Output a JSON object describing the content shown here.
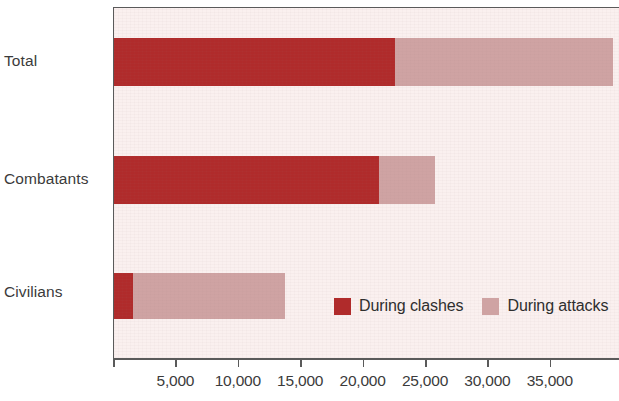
{
  "chart_data": {
    "type": "bar",
    "orientation": "horizontal",
    "stacked": true,
    "title": "",
    "subtitle": "",
    "xlabel": "",
    "ylabel": "",
    "grid": false,
    "legend_position": "inside-bottom-right",
    "categories": [
      "Total",
      "Combatants",
      "Civilians"
    ],
    "series": [
      {
        "name": "During clashes",
        "color": "#b02b2b",
        "values": [
          22500,
          21200,
          1500
        ]
      },
      {
        "name": "During attacks",
        "color": "#cfa3a3",
        "values": [
          17500,
          4500,
          12200
        ]
      }
    ],
    "totals": [
      40000,
      25700,
      13700
    ],
    "xlim": [
      0,
      40600
    ],
    "x_tick_values": [
      5000,
      10000,
      15000,
      20000,
      25000,
      30000,
      35000
    ],
    "x_tick_labels": [
      "5,000",
      "10,000",
      "15,000",
      "20,000",
      "25,000",
      "30,000",
      "35,000"
    ],
    "axis_origin_label": "",
    "plot_background": "#faf0ef",
    "axis_color": "#5a5a5a"
  },
  "y_axis": {
    "labels": [
      "Total",
      "Combatants",
      "Civilians"
    ]
  },
  "legend": {
    "entries": [
      {
        "label": "During clashes",
        "color": "#b02b2b"
      },
      {
        "label": "During attacks",
        "color": "#cfa3a3"
      }
    ]
  }
}
